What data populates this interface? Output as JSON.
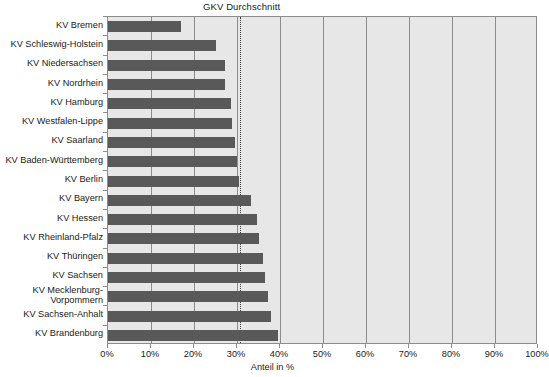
{
  "chart_data": {
    "type": "bar",
    "orientation": "horizontal",
    "title": "",
    "xlabel": "Anteil in %",
    "ylabel": "",
    "xlim": [
      0,
      100
    ],
    "grid": true,
    "legend": null,
    "categories": [
      "KV Bremen",
      "KV Schleswig-Holstein",
      "KV Niedersachsen",
      "KV Nordrhein",
      "KV Hamburg",
      "KV Westfalen-Lippe",
      "KV Saarland",
      "KV Baden-Württemberg",
      "KV Berlin",
      "KV Bayern",
      "KV Hessen",
      "KV Rheinland-Pfalz",
      "KV Thüringen",
      "KV Sachsen",
      "KV Mecklenburg-\nVorpommern",
      "KV Sachsen-Anhalt",
      "KV Brandenburg"
    ],
    "values": [
      17.0,
      25.0,
      27.3,
      27.3,
      28.6,
      28.8,
      29.5,
      30.0,
      30.5,
      33.2,
      34.6,
      35.0,
      36.0,
      36.6,
      37.2,
      38.0,
      39.6
    ],
    "xticks": [
      0,
      10,
      20,
      30,
      40,
      50,
      60,
      70,
      80,
      90,
      100
    ],
    "xtick_labels": [
      "0%",
      "10%",
      "20%",
      "30%",
      "40%",
      "50%",
      "60%",
      "70%",
      "80%",
      "90%",
      "100%"
    ],
    "annotations": [
      {
        "name": "gkv-average-line",
        "label": "GKV Durchschnitt",
        "value": 30.6,
        "style": "dotted-vertical"
      }
    ],
    "colors": {
      "bar": "#595959",
      "plot_background": "#e7e7e7",
      "gridline": "#8c8c8c",
      "average_line": "#3a3a3a",
      "page_background": "#ffffff"
    }
  }
}
